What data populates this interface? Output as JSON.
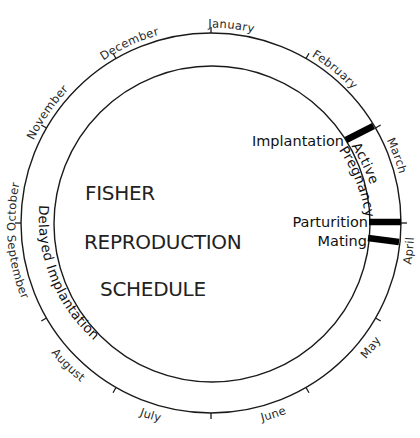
{
  "title": {
    "lines": [
      "FISHER",
      "REPRODUCTION",
      "SCHEDULE"
    ]
  },
  "months": [
    {
      "label": "January",
      "angle": 15
    },
    {
      "label": "February",
      "angle": 45
    },
    {
      "label": "March",
      "angle": 75
    },
    {
      "label": "April",
      "angle": 105
    },
    {
      "label": "May",
      "angle": 135
    },
    {
      "label": "June",
      "angle": 165
    },
    {
      "label": "July",
      "angle": 195
    },
    {
      "label": "August",
      "angle": 225
    },
    {
      "label": "September",
      "angle": 255
    },
    {
      "label": "October",
      "angle": 285
    },
    {
      "label": "November",
      "angle": 315
    },
    {
      "label": "December",
      "angle": 345
    }
  ],
  "events": {
    "implantation": "Implantation",
    "parturition": "Parturition",
    "mating": "Mating"
  },
  "phases": {
    "active_pregnancy": [
      "Active",
      "Pregnancy"
    ],
    "delayed_implantation": "Delayed Implantation"
  },
  "colors": {
    "line": "#1a1a1a",
    "bar": "#000000",
    "background": "#ffffff"
  }
}
